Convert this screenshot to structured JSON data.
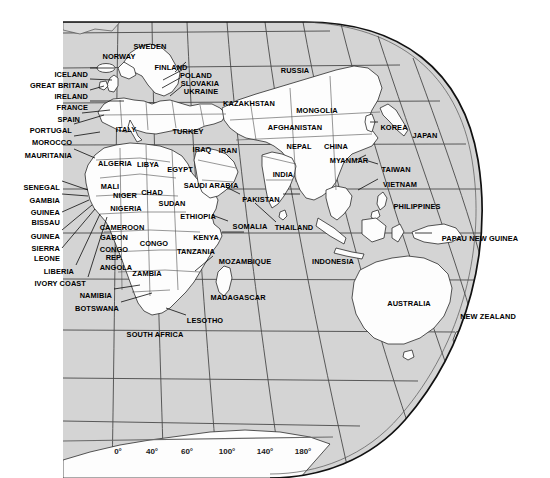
{
  "map": {
    "title": "World Map — Eastern Hemisphere",
    "projection": "globe",
    "colors": {
      "ocean": "#d4d4d4",
      "land": "#fefefe",
      "border": "#3a3a3a",
      "outline": "#1a1a1a",
      "graticule": "#4a4a4a",
      "label": "#000000",
      "background": "#ffffff"
    },
    "axis": {
      "name": "longitude-axis",
      "ticks": [
        {
          "label": "0°",
          "x": 118
        },
        {
          "label": "40°",
          "x": 152
        },
        {
          "label": "60°",
          "x": 187
        },
        {
          "label": "100°",
          "x": 227
        },
        {
          "label": "140°",
          "x": 265
        },
        {
          "label": "180°",
          "x": 303
        }
      ],
      "line_y": 441,
      "label_y": 447
    },
    "labels": [
      {
        "name": "sweden",
        "text": "SWEDEN",
        "x": 150,
        "y": 43,
        "align": "c"
      },
      {
        "name": "norway",
        "text": "NORWAY",
        "x": 119,
        "y": 53,
        "align": "c"
      },
      {
        "name": "finland",
        "text": "FINLAND",
        "x": 171,
        "y": 64,
        "align": "c"
      },
      {
        "name": "poland",
        "text": "POLAND",
        "x": 196,
        "y": 72,
        "align": "c"
      },
      {
        "name": "slovakia",
        "text": "SLOVAKIA",
        "x": 200,
        "y": 80,
        "align": "c"
      },
      {
        "name": "ukraine",
        "text": "UKRAINE",
        "x": 201,
        "y": 88,
        "align": "c"
      },
      {
        "name": "russia",
        "text": "RUSSIA",
        "x": 295,
        "y": 67,
        "align": "c"
      },
      {
        "name": "kazakhstan",
        "text": "KAZAKHSTAN",
        "x": 249,
        "y": 100,
        "align": "c"
      },
      {
        "name": "mongolia",
        "text": "MONGOLIA",
        "x": 317,
        "y": 107,
        "align": "c"
      },
      {
        "name": "iceland",
        "text": "ICELAND",
        "x": 88,
        "y": 71,
        "align": "r"
      },
      {
        "name": "great-britain",
        "text": "GREAT BRITAIN",
        "x": 88,
        "y": 82,
        "align": "r"
      },
      {
        "name": "ireland",
        "text": "IRELAND",
        "x": 88,
        "y": 93,
        "align": "r"
      },
      {
        "name": "france",
        "text": "FRANCE",
        "x": 88,
        "y": 104,
        "align": "r"
      },
      {
        "name": "spain",
        "text": "SPAIN",
        "x": 80,
        "y": 116,
        "align": "r"
      },
      {
        "name": "portugal",
        "text": "PORTUGAL",
        "x": 72,
        "y": 127,
        "align": "r"
      },
      {
        "name": "morocco",
        "text": "MOROCCO",
        "x": 72,
        "y": 139,
        "align": "r"
      },
      {
        "name": "mauritania",
        "text": "MAURITANIA",
        "x": 72,
        "y": 152,
        "align": "r"
      },
      {
        "name": "italy",
        "text": "ITALY",
        "x": 126,
        "y": 126,
        "align": "c"
      },
      {
        "name": "turkey",
        "text": "TURKEY",
        "x": 188,
        "y": 128,
        "align": "c"
      },
      {
        "name": "afghanistan",
        "text": "AFGHANISTAN",
        "x": 295,
        "y": 124,
        "align": "c"
      },
      {
        "name": "korea",
        "text": "KOREA",
        "x": 394,
        "y": 124,
        "align": "c"
      },
      {
        "name": "japan",
        "text": "JAPAN",
        "x": 425,
        "y": 132,
        "align": "c"
      },
      {
        "name": "nepal",
        "text": "NEPAL",
        "x": 299,
        "y": 143,
        "align": "c"
      },
      {
        "name": "china",
        "text": "CHINA",
        "x": 336,
        "y": 143,
        "align": "c"
      },
      {
        "name": "iraq",
        "text": "IRAQ",
        "x": 202,
        "y": 146,
        "align": "c"
      },
      {
        "name": "iran",
        "text": "IRAN",
        "x": 228,
        "y": 147,
        "align": "c"
      },
      {
        "name": "myanmar",
        "text": "MYANMAR",
        "x": 349,
        "y": 157,
        "align": "c"
      },
      {
        "name": "algeria",
        "text": "ALGERIA",
        "x": 115,
        "y": 160,
        "align": "c"
      },
      {
        "name": "libya",
        "text": "LIBYA",
        "x": 148,
        "y": 161,
        "align": "c"
      },
      {
        "name": "egypt",
        "text": "EGYPT",
        "x": 180,
        "y": 166,
        "align": "c"
      },
      {
        "name": "india",
        "text": "INDIA",
        "x": 283,
        "y": 171,
        "align": "c"
      },
      {
        "name": "taiwan",
        "text": "TAIWAN",
        "x": 396,
        "y": 166,
        "align": "c"
      },
      {
        "name": "vietnam",
        "text": "VIETNAM",
        "x": 400,
        "y": 181,
        "align": "c"
      },
      {
        "name": "senegal",
        "text": "SENEGAL",
        "x": 60,
        "y": 184,
        "align": "r"
      },
      {
        "name": "gambia",
        "text": "GAMBIA",
        "x": 60,
        "y": 197,
        "align": "r"
      },
      {
        "name": "guinea",
        "text": "GUINEA",
        "x": 60,
        "y": 209,
        "align": "r"
      },
      {
        "name": "bissau",
        "text": "BISSAU",
        "x": 60,
        "y": 219,
        "align": "r"
      },
      {
        "name": "guinea2",
        "text": "GUINEA",
        "x": 60,
        "y": 233,
        "align": "r"
      },
      {
        "name": "sierra",
        "text": "SIERRA",
        "x": 60,
        "y": 245,
        "align": "r"
      },
      {
        "name": "leone",
        "text": "LEONE",
        "x": 60,
        "y": 255,
        "align": "r"
      },
      {
        "name": "liberia",
        "text": "LIBERIA",
        "x": 74,
        "y": 268,
        "align": "r"
      },
      {
        "name": "ivory-coast",
        "text": "IVORY COAST",
        "x": 86,
        "y": 280,
        "align": "r"
      },
      {
        "name": "namibia",
        "text": "NAMIBIA",
        "x": 112,
        "y": 292,
        "align": "r"
      },
      {
        "name": "botswana",
        "text": "BOTSWANA",
        "x": 119,
        "y": 305,
        "align": "r"
      },
      {
        "name": "mali",
        "text": "MALI",
        "x": 110,
        "y": 183,
        "align": "c"
      },
      {
        "name": "niger",
        "text": "NIGER",
        "x": 125,
        "y": 192,
        "align": "c"
      },
      {
        "name": "chad",
        "text": "CHAD",
        "x": 152,
        "y": 189,
        "align": "c"
      },
      {
        "name": "nigeria",
        "text": "NIGERIA",
        "x": 126,
        "y": 205,
        "align": "c"
      },
      {
        "name": "sudan",
        "text": "SUDAN",
        "x": 172,
        "y": 200,
        "align": "c"
      },
      {
        "name": "saudi-arabia",
        "text": "SAUDI ARABIA",
        "x": 211,
        "y": 182,
        "align": "c"
      },
      {
        "name": "pakistan",
        "text": "PAKISTAN",
        "x": 261,
        "y": 196,
        "align": "c"
      },
      {
        "name": "ethiopia",
        "text": "ETHIOPIA",
        "x": 198,
        "y": 213,
        "align": "c"
      },
      {
        "name": "somalia",
        "text": "SOMALIA",
        "x": 250,
        "y": 223,
        "align": "c"
      },
      {
        "name": "thailand",
        "text": "THAILAND",
        "x": 294,
        "y": 224,
        "align": "c"
      },
      {
        "name": "philippines",
        "text": "PHILIPPINES",
        "x": 417,
        "y": 203,
        "align": "c"
      },
      {
        "name": "cameroon",
        "text": "CAMEROON",
        "x": 122,
        "y": 224,
        "align": "c"
      },
      {
        "name": "gabon",
        "text": "GABON",
        "x": 114,
        "y": 234,
        "align": "c"
      },
      {
        "name": "congo",
        "text": "CONGO",
        "x": 154,
        "y": 240,
        "align": "c"
      },
      {
        "name": "congo-rep",
        "text": "CONGO",
        "x": 114,
        "y": 246,
        "align": "c"
      },
      {
        "name": "congo-rep2",
        "text": "REP.",
        "x": 114,
        "y": 254,
        "align": "c"
      },
      {
        "name": "kenya",
        "text": "KENYA",
        "x": 206,
        "y": 234,
        "align": "c"
      },
      {
        "name": "tanzania",
        "text": "TANZANIA",
        "x": 196,
        "y": 248,
        "align": "c"
      },
      {
        "name": "angola",
        "text": "ANGOLA",
        "x": 116,
        "y": 264,
        "align": "c"
      },
      {
        "name": "zambia",
        "text": "ZAMBIA",
        "x": 147,
        "y": 270,
        "align": "c"
      },
      {
        "name": "mozambique",
        "text": "MOZAMBIQUE",
        "x": 245,
        "y": 258,
        "align": "c"
      },
      {
        "name": "papau-new-guinea",
        "text": "PAPAU NEW GUINEA",
        "x": 480,
        "y": 235,
        "align": "c"
      },
      {
        "name": "indonesia",
        "text": "INDONESIA",
        "x": 333,
        "y": 258,
        "align": "c"
      },
      {
        "name": "madagascar",
        "text": "MADAGASCAR",
        "x": 238,
        "y": 294,
        "align": "c"
      },
      {
        "name": "lesotho",
        "text": "LESOTHO",
        "x": 205,
        "y": 317,
        "align": "c"
      },
      {
        "name": "south-africa",
        "text": "SOUTH AFRICA",
        "x": 155,
        "y": 331,
        "align": "c"
      },
      {
        "name": "australia",
        "text": "AUSTRALIA",
        "x": 409,
        "y": 300,
        "align": "c"
      },
      {
        "name": "new-zealand",
        "text": "NEW ZEALAND",
        "x": 488,
        "y": 313,
        "align": "c"
      }
    ],
    "leaders": [
      {
        "name": "leader-iceland",
        "x1": 90,
        "y1": 68,
        "x2": 114,
        "y2": 68
      },
      {
        "name": "leader-great-britain",
        "x1": 90,
        "y1": 79,
        "x2": 112,
        "y2": 80
      },
      {
        "name": "leader-ireland",
        "x1": 90,
        "y1": 90,
        "x2": 104,
        "y2": 86
      },
      {
        "name": "leader-france",
        "x1": 90,
        "y1": 101,
        "x2": 124,
        "y2": 101
      },
      {
        "name": "leader-spain",
        "x1": 82,
        "y1": 113,
        "x2": 110,
        "y2": 110
      },
      {
        "name": "leader-portugal",
        "x1": 74,
        "y1": 124,
        "x2": 104,
        "y2": 115
      },
      {
        "name": "leader-morocco",
        "x1": 74,
        "y1": 136,
        "x2": 100,
        "y2": 132
      },
      {
        "name": "leader-mauritania",
        "x1": 74,
        "y1": 149,
        "x2": 95,
        "y2": 158
      },
      {
        "name": "leader-senegal",
        "x1": 62,
        "y1": 181,
        "x2": 88,
        "y2": 190
      },
      {
        "name": "leader-gambia",
        "x1": 62,
        "y1": 194,
        "x2": 88,
        "y2": 196
      },
      {
        "name": "leader-guinea-bissau",
        "x1": 62,
        "y1": 212,
        "x2": 89,
        "y2": 200
      },
      {
        "name": "leader-guinea2",
        "x1": 62,
        "y1": 230,
        "x2": 92,
        "y2": 205
      },
      {
        "name": "leader-sierra-leone",
        "x1": 62,
        "y1": 248,
        "x2": 95,
        "y2": 209
      },
      {
        "name": "leader-liberia",
        "x1": 76,
        "y1": 265,
        "x2": 100,
        "y2": 214
      },
      {
        "name": "leader-ivory-coast",
        "x1": 88,
        "y1": 277,
        "x2": 107,
        "y2": 217
      },
      {
        "name": "leader-namibia",
        "x1": 114,
        "y1": 289,
        "x2": 140,
        "y2": 285
      },
      {
        "name": "leader-botswana",
        "x1": 121,
        "y1": 302,
        "x2": 152,
        "y2": 293
      },
      {
        "name": "leader-lesotho",
        "x1": 186,
        "y1": 315,
        "x2": 166,
        "y2": 308
      },
      {
        "name": "leader-pakistan",
        "x1": 240,
        "y1": 194,
        "x2": 226,
        "y2": 187
      },
      {
        "name": "leader-pakistan-r",
        "x1": 283,
        "y1": 194,
        "x2": 300,
        "y2": 194
      },
      {
        "name": "leader-somalia",
        "x1": 228,
        "y1": 221,
        "x2": 212,
        "y2": 215
      },
      {
        "name": "leader-kenya",
        "x1": 222,
        "y1": 232,
        "x2": 244,
        "y2": 232
      },
      {
        "name": "leader-mozambique",
        "x1": 213,
        "y1": 256,
        "x2": 195,
        "y2": 271
      },
      {
        "name": "leader-thailand",
        "x1": 276,
        "y1": 222,
        "x2": 255,
        "y2": 203
      },
      {
        "name": "leader-vietnam",
        "x1": 378,
        "y1": 179,
        "x2": 358,
        "y2": 190
      },
      {
        "name": "leader-korea",
        "x1": 378,
        "y1": 122,
        "x2": 370,
        "y2": 122
      },
      {
        "name": "leader-papau",
        "x1": 432,
        "y1": 233,
        "x2": 415,
        "y2": 233
      },
      {
        "name": "leader-finland",
        "x1": 186,
        "y1": 62,
        "x2": 175,
        "y2": 72
      },
      {
        "name": "leader-poland",
        "x1": 182,
        "y1": 70,
        "x2": 163,
        "y2": 80
      },
      {
        "name": "leader-slovakia",
        "x1": 180,
        "y1": 78,
        "x2": 162,
        "y2": 88
      },
      {
        "name": "leader-ukraine",
        "x1": 182,
        "y1": 86,
        "x2": 170,
        "y2": 96
      },
      {
        "name": "leader-myanmar",
        "x1": 366,
        "y1": 155,
        "x2": 356,
        "y2": 160
      },
      {
        "name": "leader-taiwan",
        "x1": 378,
        "y1": 164,
        "x2": 365,
        "y2": 160
      }
    ],
    "graticule": {
      "parallels_y": [
        33,
        68,
        103,
        145,
        189,
        233,
        279,
        330,
        378,
        421
      ],
      "meridians": 8
    }
  }
}
